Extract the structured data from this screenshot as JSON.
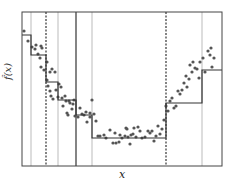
{
  "chart_data": {
    "type": "scatter",
    "title": "",
    "xlabel": "x",
    "ylabel": "f̂(x)",
    "grid": false,
    "legend": null,
    "frame_px": {
      "left": 22,
      "right": 222,
      "top": 12,
      "bottom": 166
    },
    "vertical_lines": [
      {
        "x": 31,
        "style": "thin-gray"
      },
      {
        "x": 46,
        "style": "dotted"
      },
      {
        "x": 58,
        "style": "thin-gray"
      },
      {
        "x": 76,
        "style": "solid"
      },
      {
        "x": 92,
        "style": "thin-gray"
      },
      {
        "x": 166,
        "style": "dotted"
      },
      {
        "x": 202,
        "style": "thin-gray"
      }
    ],
    "step_function": [
      {
        "x0": 22,
        "x1": 31,
        "y": 35
      },
      {
        "x0": 31,
        "x1": 46,
        "y": 55
      },
      {
        "x0": 46,
        "x1": 58,
        "y": 82
      },
      {
        "x0": 58,
        "x1": 76,
        "y": 100
      },
      {
        "x0": 76,
        "x1": 92,
        "y": 115
      },
      {
        "x0": 92,
        "x1": 166,
        "y": 138
      },
      {
        "x0": 166,
        "x1": 202,
        "y": 103
      },
      {
        "x0": 202,
        "x1": 222,
        "y": 70
      }
    ],
    "points": [
      [
        24,
        31
      ],
      [
        28,
        41
      ],
      [
        32,
        47
      ],
      [
        35,
        49
      ],
      [
        36,
        45
      ],
      [
        38,
        54
      ],
      [
        40,
        58
      ],
      [
        41,
        46
      ],
      [
        42,
        48
      ],
      [
        41,
        67
      ],
      [
        44,
        70
      ],
      [
        47,
        62
      ],
      [
        47,
        80
      ],
      [
        50,
        72
      ],
      [
        52,
        69
      ],
      [
        55,
        72
      ],
      [
        48,
        86
      ],
      [
        50,
        91
      ],
      [
        51,
        96
      ],
      [
        53,
        99
      ],
      [
        56,
        90
      ],
      [
        58,
        97
      ],
      [
        59,
        84
      ],
      [
        61,
        87
      ],
      [
        62,
        98
      ],
      [
        63,
        106
      ],
      [
        65,
        96
      ],
      [
        66,
        101
      ],
      [
        67,
        113
      ],
      [
        68,
        115
      ],
      [
        69,
        101
      ],
      [
        70,
        103
      ],
      [
        72,
        109
      ],
      [
        73,
        104
      ],
      [
        74,
        100
      ],
      [
        75,
        116
      ],
      [
        78,
        117
      ],
      [
        80,
        108
      ],
      [
        82,
        114
      ],
      [
        84,
        115
      ],
      [
        86,
        112
      ],
      [
        87,
        122
      ],
      [
        90,
        113
      ],
      [
        90,
        117
      ],
      [
        92,
        100
      ],
      [
        94,
        114
      ],
      [
        96,
        121
      ],
      [
        98,
        136
      ],
      [
        100,
        136
      ],
      [
        104,
        135
      ],
      [
        106,
        138
      ],
      [
        110,
        130
      ],
      [
        113,
        143
      ],
      [
        115,
        133
      ],
      [
        116,
        143
      ],
      [
        119,
        142
      ],
      [
        120,
        135
      ],
      [
        122,
        138
      ],
      [
        125,
        136
      ],
      [
        126,
        128
      ],
      [
        127,
        129
      ],
      [
        128,
        137
      ],
      [
        130,
        144
      ],
      [
        131,
        135
      ],
      [
        133,
        134
      ],
      [
        134,
        128
      ],
      [
        136,
        137
      ],
      [
        138,
        127
      ],
      [
        140,
        131
      ],
      [
        142,
        138
      ],
      [
        145,
        137
      ],
      [
        148,
        131
      ],
      [
        150,
        133
      ],
      [
        152,
        131
      ],
      [
        154,
        141
      ],
      [
        156,
        136
      ],
      [
        158,
        126
      ],
      [
        160,
        134
      ],
      [
        162,
        129
      ],
      [
        164,
        120
      ],
      [
        166,
        106
      ],
      [
        168,
        111
      ],
      [
        170,
        101
      ],
      [
        172,
        98
      ],
      [
        174,
        108
      ],
      [
        176,
        106
      ],
      [
        178,
        91
      ],
      [
        180,
        94
      ],
      [
        182,
        90
      ],
      [
        184,
        83
      ],
      [
        186,
        76
      ],
      [
        187,
        87
      ],
      [
        189,
        79
      ],
      [
        190,
        65
      ],
      [
        192,
        72
      ],
      [
        193,
        62
      ],
      [
        195,
        68
      ],
      [
        197,
        69
      ],
      [
        199,
        78
      ],
      [
        200,
        62
      ],
      [
        203,
        58
      ],
      [
        205,
        72
      ],
      [
        208,
        51
      ],
      [
        210,
        55
      ],
      [
        211,
        48
      ],
      [
        212,
        67
      ],
      [
        214,
        58
      ]
    ]
  },
  "axis": {
    "x_label": "x",
    "y_label": "f̂(x)"
  }
}
